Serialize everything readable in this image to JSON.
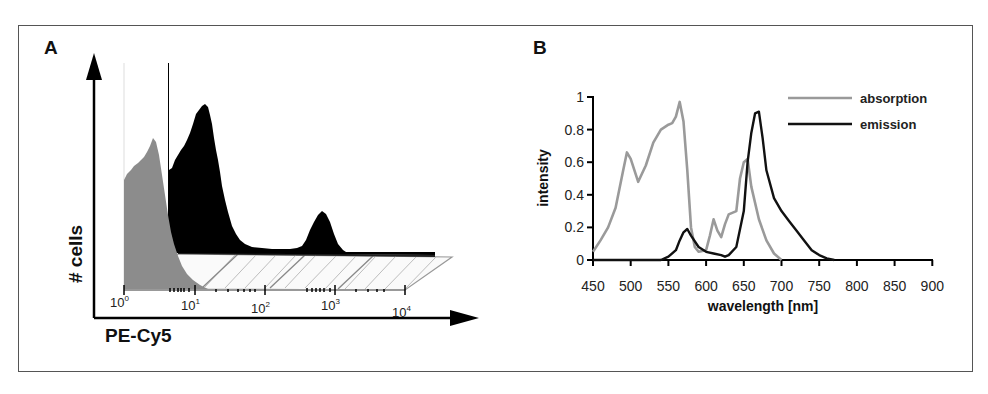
{
  "panel_a": {
    "letter": "A",
    "ylabel": "# cells",
    "xlabel": "PE-Cy5",
    "log_ticks": [
      {
        "base": "10",
        "exp": "0"
      },
      {
        "base": "10",
        "exp": "1"
      },
      {
        "base": "10",
        "exp": "2"
      },
      {
        "base": "10",
        "exp": "3"
      },
      {
        "base": "10",
        "exp": "4"
      }
    ]
  },
  "panel_b": {
    "letter": "B",
    "ylabel": "intensity",
    "xlabel": "wavelength [nm]",
    "yticks": [
      "0",
      "0.2",
      "0.4",
      "0.6",
      "0.8",
      "1"
    ],
    "xticks": [
      "450",
      "500",
      "550",
      "600",
      "650",
      "700",
      "750",
      "800",
      "850",
      "900"
    ],
    "legend": [
      {
        "label": "absorption",
        "color": "#9a9a9a"
      },
      {
        "label": "emission",
        "color": "#111111"
      }
    ]
  },
  "chart_data": [
    {
      "type": "area",
      "title": "A",
      "xlabel": "PE-Cy5",
      "ylabel": "# cells",
      "xscale": "log",
      "xlim": [
        1,
        10000
      ],
      "tick_labels": [
        "10^0",
        "10^1",
        "10^2",
        "10^3",
        "10^4"
      ],
      "series": [
        {
          "name": "control (gray, front)",
          "color": "#8c8c8c",
          "x": [
            1,
            1.3,
            1.7,
            2.2,
            2.8,
            3.5,
            4.5,
            6,
            8,
            10,
            14
          ],
          "y": [
            0.55,
            0.63,
            0.68,
            0.74,
            0.78,
            0.72,
            0.52,
            0.3,
            0.12,
            0.04,
            0.0
          ]
        },
        {
          "name": "stained (black, back)",
          "color": "#000000",
          "x": [
            4.5,
            5,
            7,
            10,
            13,
            18,
            25,
            40,
            80,
            200,
            400,
            600,
            750,
            900,
            1200
          ],
          "y": [
            0.0,
            0.55,
            0.72,
            0.86,
            0.95,
            0.82,
            0.5,
            0.2,
            0.03,
            0.0,
            0.03,
            0.22,
            0.3,
            0.2,
            0.0
          ]
        }
      ],
      "grid": false
    },
    {
      "type": "line",
      "title": "B",
      "xlabel": "wavelength [nm]",
      "ylabel": "intensity",
      "xlim": [
        450,
        900
      ],
      "ylim": [
        0,
        1
      ],
      "xticks": [
        450,
        500,
        550,
        600,
        650,
        700,
        750,
        800,
        850,
        900
      ],
      "yticks": [
        0,
        0.2,
        0.4,
        0.6,
        0.8,
        1
      ],
      "legend_position": "upper right",
      "grid": false,
      "series": [
        {
          "name": "absorption",
          "color": "#9a9a9a",
          "x": [
            450,
            460,
            470,
            480,
            490,
            495,
            500,
            510,
            520,
            530,
            540,
            550,
            555,
            560,
            565,
            570,
            575,
            580,
            585,
            590,
            600,
            605,
            610,
            615,
            620,
            625,
            630,
            640,
            645,
            650,
            655,
            660,
            670,
            680,
            690,
            700
          ],
          "y": [
            0.05,
            0.12,
            0.2,
            0.32,
            0.55,
            0.66,
            0.62,
            0.48,
            0.58,
            0.72,
            0.8,
            0.83,
            0.84,
            0.88,
            0.97,
            0.85,
            0.55,
            0.2,
            0.08,
            0.05,
            0.06,
            0.15,
            0.25,
            0.18,
            0.14,
            0.22,
            0.28,
            0.3,
            0.5,
            0.6,
            0.62,
            0.45,
            0.25,
            0.12,
            0.04,
            0.0
          ]
        },
        {
          "name": "emission",
          "color": "#111111",
          "x": [
            540,
            550,
            560,
            565,
            570,
            575,
            580,
            590,
            600,
            610,
            620,
            625,
            630,
            640,
            650,
            655,
            660,
            665,
            670,
            675,
            680,
            690,
            700,
            710,
            720,
            730,
            740,
            750,
            760,
            770
          ],
          "y": [
            0.0,
            0.02,
            0.06,
            0.12,
            0.17,
            0.19,
            0.15,
            0.08,
            0.05,
            0.04,
            0.03,
            0.02,
            0.03,
            0.08,
            0.3,
            0.6,
            0.78,
            0.9,
            0.91,
            0.75,
            0.55,
            0.38,
            0.3,
            0.24,
            0.18,
            0.12,
            0.06,
            0.03,
            0.01,
            0.0
          ]
        }
      ]
    }
  ]
}
